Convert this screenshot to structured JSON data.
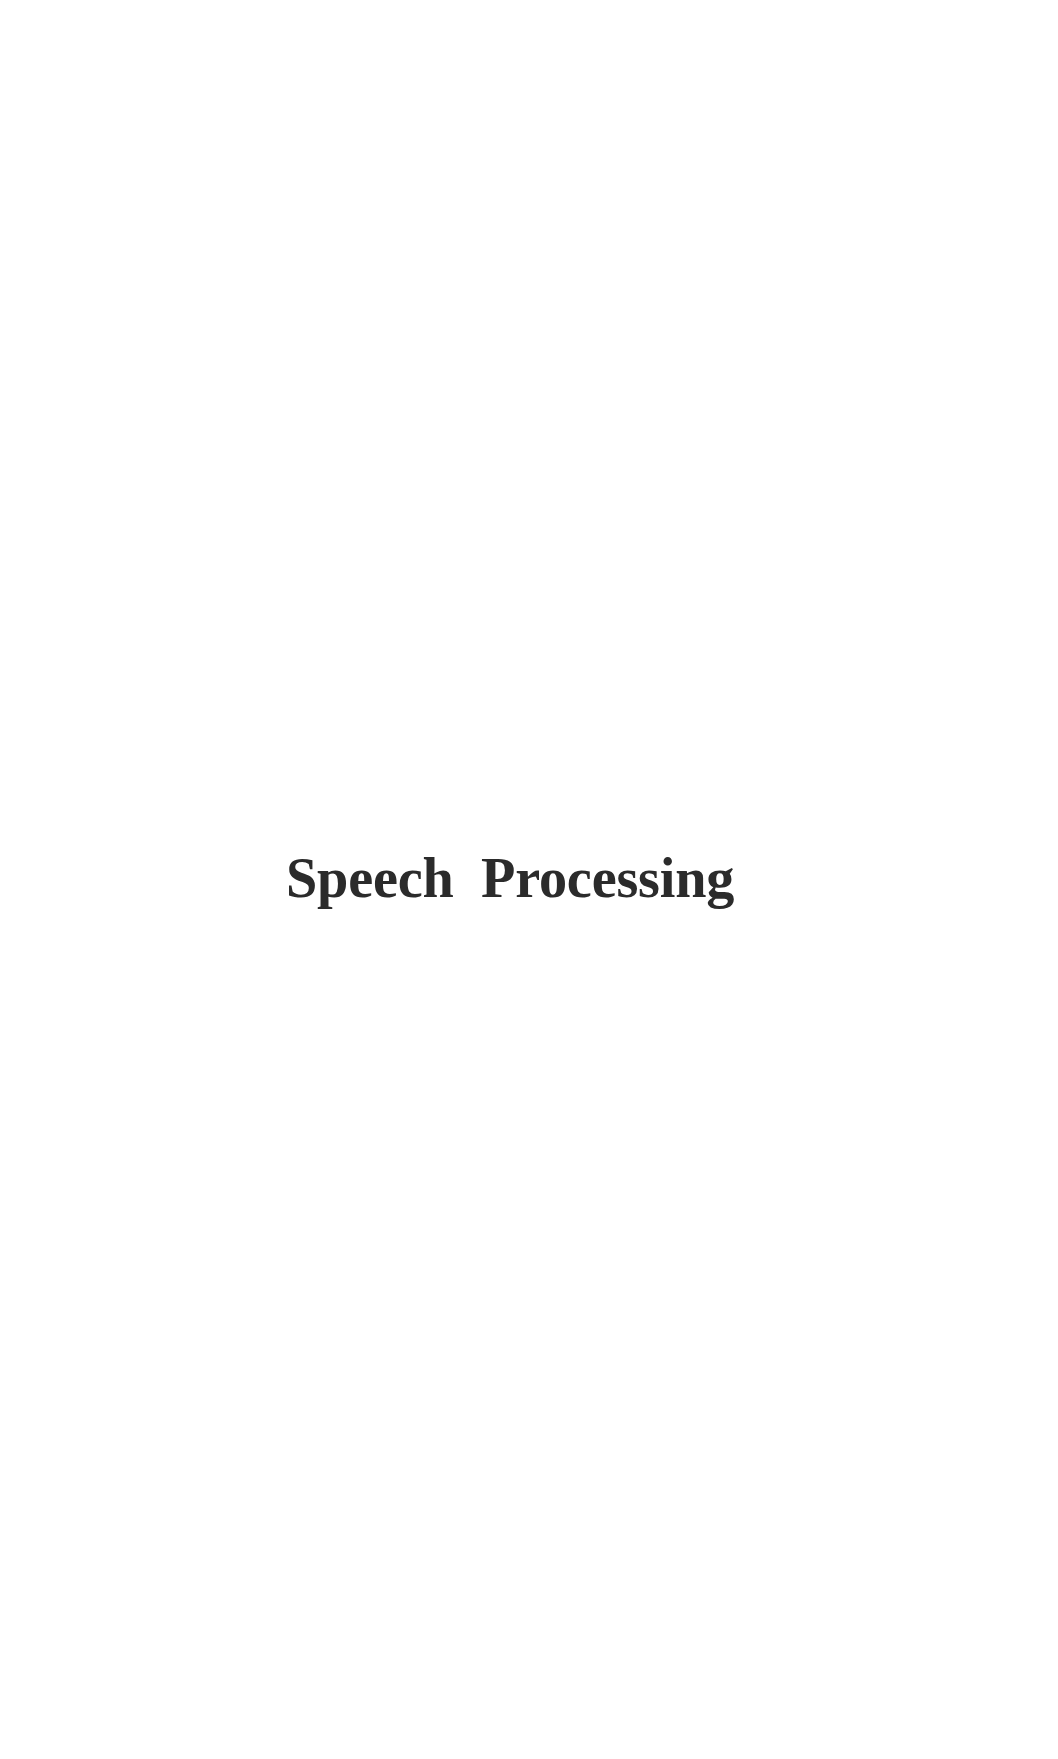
{
  "document": {
    "background_color": "#ffffff",
    "text_color": "#2b2b2b",
    "page_width": 1058,
    "page_height": 1759
  },
  "heading": {
    "full_text": "Speech Processing",
    "word_first": "Speech",
    "word_second": "Processing"
  }
}
